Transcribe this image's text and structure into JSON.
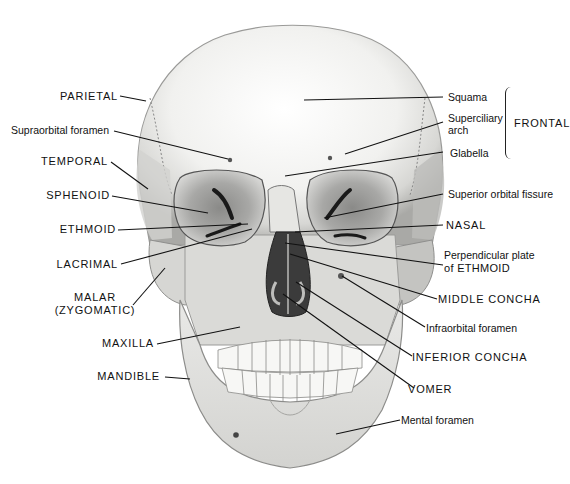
{
  "diagram": {
    "left_labels": [
      {
        "id": "parietal",
        "text": "PARIETAL",
        "caps": true
      },
      {
        "id": "supraorbital-foramen",
        "text": "Supraorbital foramen",
        "caps": false
      },
      {
        "id": "temporal",
        "text": "TEMPORAL",
        "caps": true
      },
      {
        "id": "sphenoid",
        "text": "SPHENOID",
        "caps": true
      },
      {
        "id": "ethmoid",
        "text": "ETHMOID",
        "caps": true
      },
      {
        "id": "lacrimal",
        "text": "LACRIMAL",
        "caps": true
      },
      {
        "id": "malar",
        "text": "MALAR",
        "caps": true
      },
      {
        "id": "zygomatic",
        "text": "(ZYGOMATIC)",
        "caps": true
      },
      {
        "id": "maxilla",
        "text": "MAXILLA",
        "caps": true
      },
      {
        "id": "mandible",
        "text": "MANDIBLE",
        "caps": true
      }
    ],
    "right_labels": [
      {
        "id": "squama",
        "text": "Squama",
        "caps": false
      },
      {
        "id": "superciliary-1",
        "text": "Superciliary",
        "caps": false
      },
      {
        "id": "superciliary-2",
        "text": "arch",
        "caps": false
      },
      {
        "id": "glabella",
        "text": "Glabella",
        "caps": false
      },
      {
        "id": "superior-orbital-fissure",
        "text": "Superior orbital fissure",
        "caps": false
      },
      {
        "id": "nasal",
        "text": "NASAL",
        "caps": true
      },
      {
        "id": "perpendicular-plate-1",
        "text": "Perpendicular plate",
        "caps": false
      },
      {
        "id": "perpendicular-plate-2",
        "text": "of ETHMOID",
        "caps": false
      },
      {
        "id": "middle-concha",
        "text": "MIDDLE CONCHA",
        "caps": true
      },
      {
        "id": "infraorbital-foramen",
        "text": "Infraorbital foramen",
        "caps": false
      },
      {
        "id": "inferior-concha",
        "text": "INFERIOR CONCHA",
        "caps": true
      },
      {
        "id": "vomer",
        "text": "VOMER",
        "caps": true
      },
      {
        "id": "mental-foramen",
        "text": "Mental foramen",
        "caps": false
      }
    ],
    "group_label": {
      "text": "FRONTAL",
      "groups": [
        "Squama",
        "Superciliary arch",
        "Glabella"
      ]
    },
    "colors": {
      "bone_light": "#f4f4f2",
      "bone_mid": "#c9c9c6",
      "bone_shadow": "#8e8e8c",
      "cavity": "#3a3a3a",
      "line": "#111111"
    }
  }
}
